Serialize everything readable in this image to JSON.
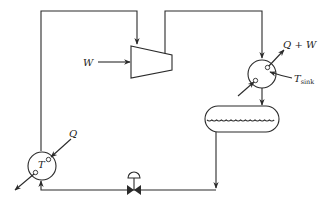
{
  "diagram": {
    "type": "heat-pump-refrigeration-cycle",
    "components": {
      "compressor": {
        "label": "W",
        "shape": "trapezoid"
      },
      "condenser": {
        "label_out": "Q + W",
        "label_temp": "T",
        "label_temp_sub": "sink",
        "shape": "circle"
      },
      "receiver": {
        "shape": "horizontal-drum"
      },
      "expansion_valve": {
        "shape": "control-valve"
      },
      "evaporator": {
        "label_in": "Q",
        "label_temp": "T",
        "shape": "circle"
      }
    },
    "colors": {
      "line": "#2a2a2a",
      "background": "#ffffff"
    }
  }
}
